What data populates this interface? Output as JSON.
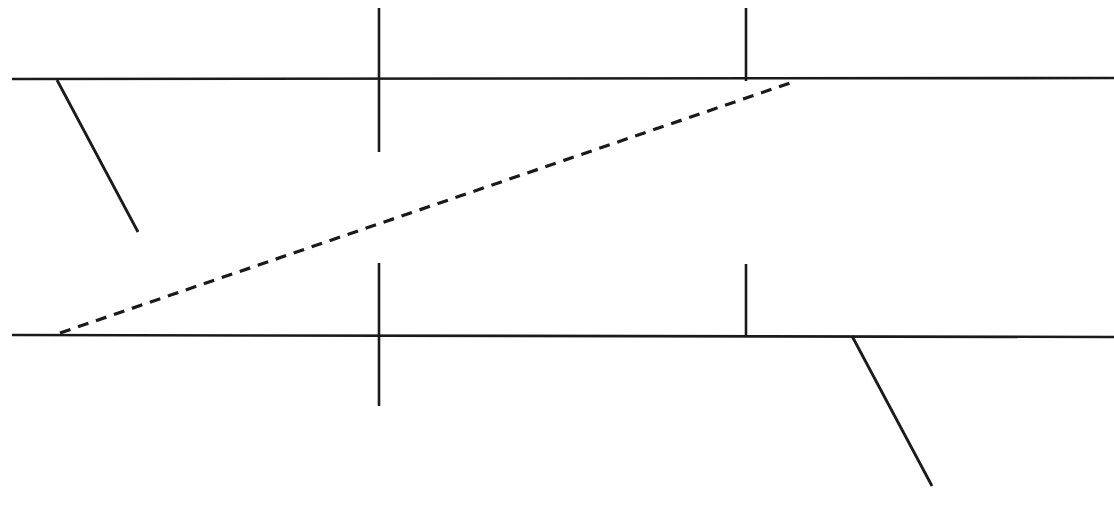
{
  "canvas": {
    "width": 1114,
    "height": 506,
    "background_color": "#ffffff"
  },
  "style": {
    "line_color": "#1a1a1a",
    "boundary_stroke_width": 2.6,
    "tick_stroke_width": 2.6,
    "diagonal_stroke_width": 2.8,
    "dashed_stroke_width": 3.2,
    "dash_pattern": "11 8"
  },
  "chart_data": {
    "type": "line",
    "title": "",
    "xlabel": "",
    "ylabel": "",
    "grid": false,
    "legend": null,
    "xlim": [
      0,
      1114
    ],
    "ylim": [
      506,
      0
    ],
    "annotations": [],
    "series": [
      {
        "name": "upper-boundary-line",
        "style": "solid",
        "points": [
          [
            12,
            79
          ],
          [
            1114,
            78
          ]
        ]
      },
      {
        "name": "lower-boundary-line",
        "style": "solid",
        "points": [
          [
            12,
            335
          ],
          [
            1114,
            337
          ]
        ]
      },
      {
        "name": "upper-left-branch-line",
        "style": "solid",
        "points": [
          [
            57,
            80
          ],
          [
            138,
            232
          ]
        ]
      },
      {
        "name": "lower-right-branch-line",
        "style": "solid",
        "points": [
          [
            852,
            336
          ],
          [
            932,
            486
          ]
        ]
      },
      {
        "name": "dashed-transition-path",
        "style": "dashed",
        "points": [
          [
            60,
            333
          ],
          [
            790,
            83
          ]
        ]
      },
      {
        "name": "upper-tick-crossing",
        "style": "solid",
        "points": [
          [
            379,
            8
          ],
          [
            379,
            152
          ]
        ]
      },
      {
        "name": "upper-tick-stub",
        "style": "solid",
        "points": [
          [
            746,
            8
          ],
          [
            746,
            81
          ]
        ]
      },
      {
        "name": "lower-tick-crossing",
        "style": "solid",
        "points": [
          [
            379,
            263
          ],
          [
            379,
            406
          ]
        ]
      },
      {
        "name": "lower-tick-stub",
        "style": "solid",
        "points": [
          [
            746,
            264
          ],
          [
            746,
            336
          ]
        ]
      }
    ]
  }
}
